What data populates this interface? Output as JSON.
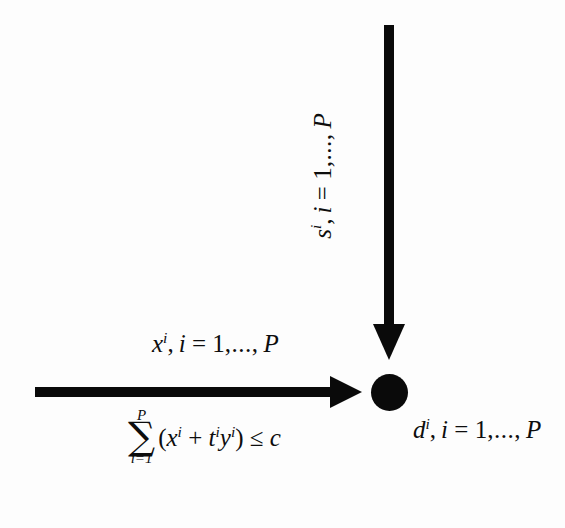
{
  "diagram": {
    "background_color": "#fdfdfd",
    "ink_color": "#0d0d0d",
    "node": {
      "shape": "filled-circle",
      "color": "#0a0a0a",
      "center_x": 390,
      "center_y": 392,
      "diameter": 37
    },
    "arrows": [
      {
        "name": "horizontal-input-arrow",
        "direction": "left-to-right",
        "from_x": 35,
        "from_y": 392,
        "to_x": 361,
        "to_y": 392,
        "shaft_thickness": 9
      },
      {
        "name": "vertical-supply-arrow",
        "direction": "top-to-bottom",
        "from_x": 389,
        "from_y": 25,
        "to_x": 389,
        "to_y": 360,
        "shaft_thickness": 9
      }
    ]
  },
  "labels": {
    "horizontal_flow": {
      "name": "x-flow-label",
      "variable": "x",
      "superscript": "i",
      "index_text": ", i = 1, ..., P",
      "full_text": "x^i, i = 1, ..., P"
    },
    "vertical_flow": {
      "name": "s-flow-label",
      "variable": "s",
      "superscript": "i",
      "index_text": ", i = 1, ..., P",
      "full_text": "s^i, i = 1, ..., P",
      "rotation_degrees": -90
    },
    "node_label": {
      "name": "d-node-label",
      "variable": "d",
      "superscript": "i",
      "index_text": ", i = 1, ..., P",
      "full_text": "d^i, i = 1, ..., P"
    }
  },
  "constraint": {
    "name": "budget-constraint",
    "sum_symbol": "∑",
    "sum_upper_limit": "P",
    "sum_lower_limit": "i=1",
    "open_paren": "(",
    "term_one_var": "x",
    "term_one_sup": "i",
    "plus_op": "+",
    "term_two_var": "t",
    "term_two_sup": "i",
    "term_three_var": "y",
    "term_three_sup": "i",
    "close_paren": ")",
    "relation": "≤",
    "bound": "c",
    "full_text": "∑_{i=1}^{P} (x^i + t^i y^i) ≤ c"
  },
  "index_parts": {
    "comma": ",",
    "index_var": "i",
    "equals": "=",
    "one": "1",
    "ellipsis": ",...,",
    "upper": "P"
  }
}
